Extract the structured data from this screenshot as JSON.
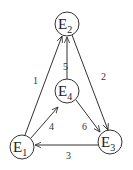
{
  "diagram": {
    "type": "directed-graph",
    "nodes": [
      {
        "id": "E1",
        "base": "E",
        "sub": "1",
        "cx": 22,
        "cy": 147,
        "r": 12
      },
      {
        "id": "E2",
        "base": "E",
        "sub": "2",
        "cx": 67,
        "cy": 24,
        "r": 12
      },
      {
        "id": "E3",
        "base": "E",
        "sub": "3",
        "cx": 110,
        "cy": 142,
        "r": 12
      },
      {
        "id": "E4",
        "base": "E",
        "sub": "4",
        "cx": 67,
        "cy": 91,
        "r": 12
      }
    ],
    "edges": [
      {
        "label": "1",
        "from": "E1",
        "to": "E2"
      },
      {
        "label": "2",
        "from": "E2",
        "to": "E3"
      },
      {
        "label": "3",
        "from": "E3",
        "to": "E1"
      },
      {
        "label": "4",
        "from": "E1",
        "to": "E4"
      },
      {
        "label": "5",
        "from": "E4",
        "to": "E2"
      },
      {
        "label": "6",
        "from": "E4",
        "to": "E3"
      }
    ]
  }
}
